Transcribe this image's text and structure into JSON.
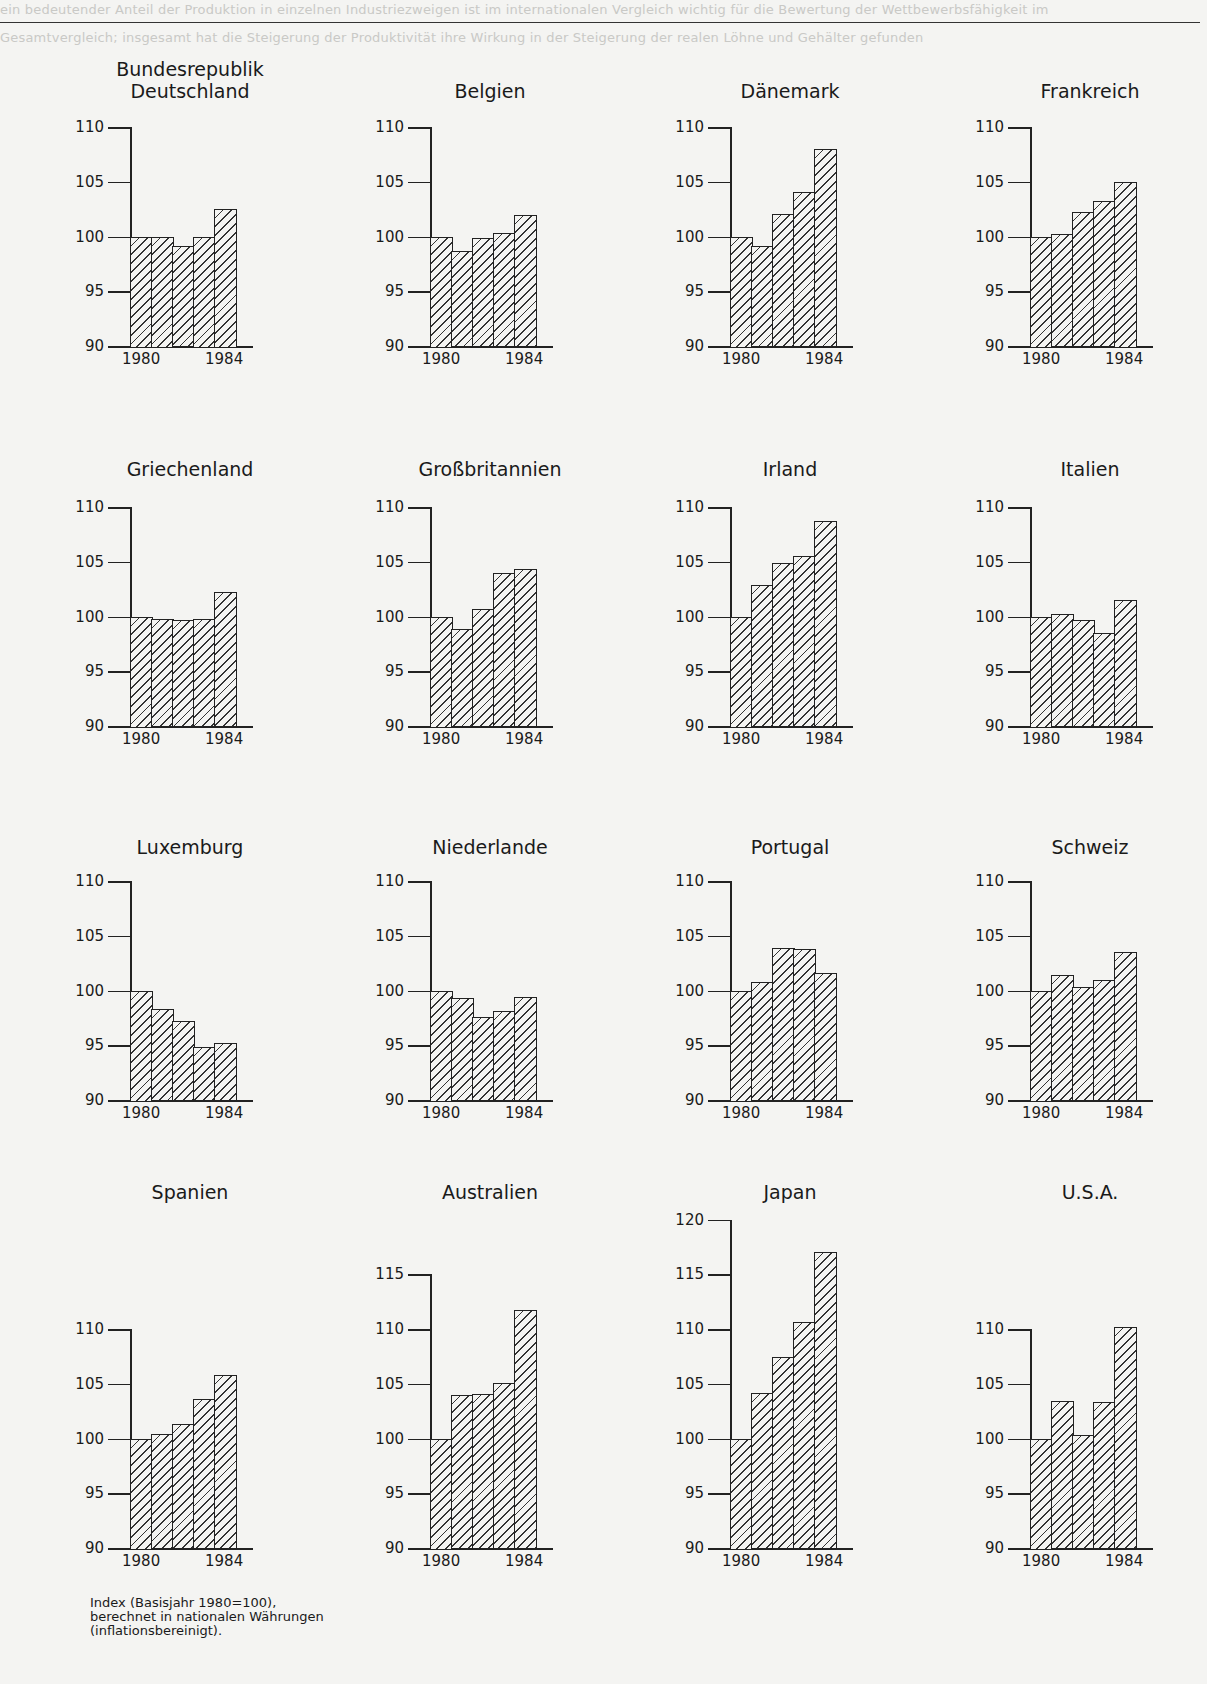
{
  "page": {
    "footnote_lines": [
      "Index (Basisjahr 1980=100),",
      "berechnet in nationalen Währungen",
      "(inflationsbereinigt)."
    ]
  },
  "chart_data": [
    {
      "type": "bar",
      "title": "Bundesrepublik\nDeutschland",
      "categories": [
        "1980",
        "1981",
        "1982",
        "1983",
        "1984"
      ],
      "values": [
        100,
        100,
        99.1,
        100,
        102.5
      ],
      "x_tick_labels": [
        "1980",
        "1984"
      ],
      "y_ticks": [
        90,
        95,
        100,
        105,
        110
      ],
      "ylim": [
        90,
        110
      ],
      "xlabel": "",
      "ylabel": "",
      "grid": false
    },
    {
      "type": "bar",
      "title": "Belgien",
      "categories": [
        "1980",
        "1981",
        "1982",
        "1983",
        "1984"
      ],
      "values": [
        100,
        98.7,
        99.9,
        100.3,
        102.0
      ],
      "x_tick_labels": [
        "1980",
        "1984"
      ],
      "y_ticks": [
        90,
        95,
        100,
        105,
        110
      ],
      "ylim": [
        90,
        110
      ],
      "xlabel": "",
      "ylabel": "",
      "grid": false
    },
    {
      "type": "bar",
      "title": "Dänemark",
      "categories": [
        "1980",
        "1981",
        "1982",
        "1983",
        "1984"
      ],
      "values": [
        100,
        99.1,
        102.1,
        104.1,
        108.0
      ],
      "x_tick_labels": [
        "1980",
        "1984"
      ],
      "y_ticks": [
        90,
        95,
        100,
        105,
        110
      ],
      "ylim": [
        90,
        110
      ],
      "xlabel": "",
      "ylabel": "",
      "grid": false
    },
    {
      "type": "bar",
      "title": "Frankreich",
      "categories": [
        "1980",
        "1981",
        "1982",
        "1983",
        "1984"
      ],
      "values": [
        100,
        100.2,
        102.2,
        103.2,
        105.0
      ],
      "x_tick_labels": [
        "1980",
        "1984"
      ],
      "y_ticks": [
        90,
        95,
        100,
        105,
        110
      ],
      "ylim": [
        90,
        110
      ],
      "xlabel": "",
      "ylabel": "",
      "grid": false
    },
    {
      "type": "bar",
      "title": "Griechenland",
      "categories": [
        "1980",
        "1981",
        "1982",
        "1983",
        "1984"
      ],
      "values": [
        100,
        99.8,
        99.7,
        99.8,
        102.2
      ],
      "x_tick_labels": [
        "1980",
        "1984"
      ],
      "y_ticks": [
        90,
        95,
        100,
        105,
        110
      ],
      "ylim": [
        90,
        110
      ],
      "xlabel": "",
      "ylabel": "",
      "grid": false
    },
    {
      "type": "bar",
      "title": "Großbritannien",
      "categories": [
        "1980",
        "1981",
        "1982",
        "1983",
        "1984"
      ],
      "values": [
        100,
        98.9,
        100.7,
        104.0,
        104.3
      ],
      "x_tick_labels": [
        "1980",
        "1984"
      ],
      "y_ticks": [
        90,
        95,
        100,
        105,
        110
      ],
      "ylim": [
        90,
        110
      ],
      "xlabel": "",
      "ylabel": "",
      "grid": false
    },
    {
      "type": "bar",
      "title": "Irland",
      "categories": [
        "1980",
        "1981",
        "1982",
        "1983",
        "1984"
      ],
      "values": [
        100,
        102.9,
        104.9,
        105.5,
        108.7
      ],
      "x_tick_labels": [
        "1980",
        "1984"
      ],
      "y_ticks": [
        90,
        95,
        100,
        105,
        110
      ],
      "ylim": [
        90,
        110
      ],
      "xlabel": "",
      "ylabel": "",
      "grid": false
    },
    {
      "type": "bar",
      "title": "Italien",
      "categories": [
        "1980",
        "1981",
        "1982",
        "1983",
        "1984"
      ],
      "values": [
        100,
        100.2,
        99.7,
        98.5,
        101.5
      ],
      "x_tick_labels": [
        "1980",
        "1984"
      ],
      "y_ticks": [
        90,
        95,
        100,
        105,
        110
      ],
      "ylim": [
        90,
        110
      ],
      "xlabel": "",
      "ylabel": "",
      "grid": false
    },
    {
      "type": "bar",
      "title": "Luxemburg",
      "categories": [
        "1980",
        "1981",
        "1982",
        "1983",
        "1984"
      ],
      "values": [
        100,
        98.3,
        97.2,
        94.8,
        95.2
      ],
      "x_tick_labels": [
        "1980",
        "1984"
      ],
      "y_ticks": [
        90,
        95,
        100,
        105,
        110
      ],
      "ylim": [
        90,
        110
      ],
      "xlabel": "",
      "ylabel": "",
      "grid": false
    },
    {
      "type": "bar",
      "title": "Niederlande",
      "categories": [
        "1980",
        "1981",
        "1982",
        "1983",
        "1984"
      ],
      "values": [
        100,
        99.3,
        97.6,
        98.1,
        99.4
      ],
      "x_tick_labels": [
        "1980",
        "1984"
      ],
      "y_ticks": [
        90,
        95,
        100,
        105,
        110
      ],
      "ylim": [
        90,
        110
      ],
      "xlabel": "",
      "ylabel": "",
      "grid": false
    },
    {
      "type": "bar",
      "title": "Portugal",
      "categories": [
        "1980",
        "1981",
        "1982",
        "1983",
        "1984"
      ],
      "values": [
        100,
        100.8,
        103.9,
        103.8,
        101.6
      ],
      "x_tick_labels": [
        "1980",
        "1984"
      ],
      "y_ticks": [
        90,
        95,
        100,
        105,
        110
      ],
      "ylim": [
        90,
        110
      ],
      "xlabel": "",
      "ylabel": "",
      "grid": false
    },
    {
      "type": "bar",
      "title": "Schweiz",
      "categories": [
        "1980",
        "1981",
        "1982",
        "1983",
        "1984"
      ],
      "values": [
        100,
        101.4,
        100.3,
        101.0,
        103.5
      ],
      "x_tick_labels": [
        "1980",
        "1984"
      ],
      "y_ticks": [
        90,
        95,
        100,
        105,
        110
      ],
      "ylim": [
        90,
        110
      ],
      "xlabel": "",
      "ylabel": "",
      "grid": false
    },
    {
      "type": "bar",
      "title": "Spanien",
      "categories": [
        "1980",
        "1981",
        "1982",
        "1983",
        "1984"
      ],
      "values": [
        100,
        100.4,
        101.3,
        103.6,
        105.8
      ],
      "x_tick_labels": [
        "1980",
        "1984"
      ],
      "y_ticks": [
        90,
        95,
        100,
        105,
        110
      ],
      "ylim": [
        90,
        110
      ],
      "xlabel": "",
      "ylabel": "",
      "grid": false
    },
    {
      "type": "bar",
      "title": "Australien",
      "categories": [
        "1980",
        "1981",
        "1982",
        "1983",
        "1984"
      ],
      "values": [
        100,
        104.0,
        104.1,
        105.1,
        111.7
      ],
      "x_tick_labels": [
        "1980",
        "1984"
      ],
      "y_ticks": [
        90,
        95,
        100,
        105,
        110,
        115
      ],
      "ylim": [
        90,
        115
      ],
      "xlabel": "",
      "ylabel": "",
      "grid": false
    },
    {
      "type": "bar",
      "title": "Japan",
      "categories": [
        "1980",
        "1981",
        "1982",
        "1983",
        "1984"
      ],
      "values": [
        100,
        104.2,
        107.4,
        110.6,
        117.0
      ],
      "x_tick_labels": [
        "1980",
        "1984"
      ],
      "y_ticks": [
        90,
        95,
        100,
        105,
        110,
        115,
        120
      ],
      "ylim": [
        90,
        120
      ],
      "xlabel": "",
      "ylabel": "",
      "grid": false
    },
    {
      "type": "bar",
      "title": "U.S.A.",
      "categories": [
        "1980",
        "1981",
        "1982",
        "1983",
        "1984"
      ],
      "values": [
        100,
        103.4,
        100.3,
        103.3,
        110.2
      ],
      "x_tick_labels": [
        "1980",
        "1984"
      ],
      "y_ticks": [
        90,
        95,
        100,
        105,
        110
      ],
      "ylim": [
        90,
        110
      ],
      "xlabel": "",
      "ylabel": "",
      "grid": false
    }
  ]
}
